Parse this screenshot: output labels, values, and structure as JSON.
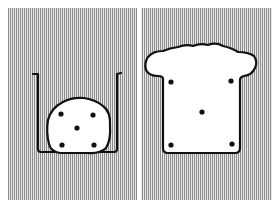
{
  "figure": {
    "panels": [
      {
        "id": "left",
        "description": "Irregular blob with five dots resting inside a U-shaped container",
        "background": "vertical-stripes",
        "dots": 5
      },
      {
        "id": "right",
        "description": "Bread-slice shaped outline with five dots, no container",
        "background": "vertical-stripes",
        "dots": 5
      }
    ],
    "colors": {
      "stripe_dark": "#8a8a8a",
      "stripe_light": "#e6e6e6",
      "outline": "#111111",
      "fill": "#ffffff"
    }
  }
}
